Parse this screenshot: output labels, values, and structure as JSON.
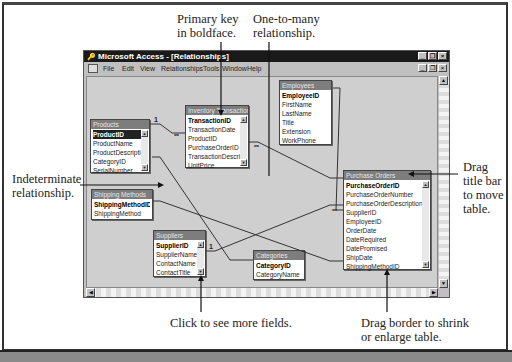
{
  "window": {
    "title": "Microsoft Access - [Relationships]",
    "controls": [
      "_",
      "❐",
      "×"
    ],
    "mdi_controls": [
      "_",
      "❐",
      "×"
    ]
  },
  "menu": [
    "File",
    "Edit",
    "View",
    "Relationships",
    "Tools",
    "Window",
    "Help"
  ],
  "tables": {
    "products": {
      "title": "Products",
      "fields": [
        "ProductID",
        "ProductName",
        "ProductDescriptic",
        "CategoryID",
        "SerialNumber"
      ],
      "primary_key": "ProductID"
    },
    "inventory_transactions": {
      "title": "Inventory Transactions",
      "fields": [
        "TransactionID",
        "TransactionDate",
        "ProductID",
        "PurchaseOrderID",
        "TransactionDescript",
        "UnitPrice"
      ],
      "primary_key": "TransactionID"
    },
    "employees": {
      "title": "Employees",
      "fields": [
        "EmployeeID",
        "FirstName",
        "LastName",
        "Title",
        "Extension",
        "WorkPhone"
      ],
      "primary_key": "EmployeeID"
    },
    "shipping_methods": {
      "title": "Shipping Methods",
      "fields": [
        "ShippingMethodID",
        "ShippingMethod"
      ],
      "primary_key": "ShippingMethodID"
    },
    "purchase_orders": {
      "title": "Purchase Orders",
      "fields": [
        "PurchaseOrderID",
        "PurchaseOrderNumber",
        "PurchaseOrderDescription",
        "SupplierID",
        "EmployeeID",
        "OrderDate",
        "DateRequired",
        "DatePromised",
        "ShipDate",
        "ShippingMethodID"
      ],
      "primary_key": "PurchaseOrderID"
    },
    "suppliers": {
      "title": "Suppliers",
      "fields": [
        "SupplierID",
        "SupplierName",
        "ContactName",
        "ContactTitle"
      ],
      "primary_key": "SupplierID"
    },
    "categories": {
      "title": "Categories",
      "fields": [
        "CategoryID",
        "CategoryName"
      ],
      "primary_key": "CategoryID"
    }
  },
  "relationship_symbols": {
    "one": "1",
    "many": "∞"
  },
  "callouts": {
    "primary_key": "Primary key\nin boldface.",
    "one_to_many": "One-to-many\nrelationship.",
    "drag_title": "Drag\ntitle bar\nto move\ntable.",
    "indeterminate": "Indeterminate\nrelationship.",
    "more_fields": "Click to see more fields.",
    "drag_border": "Drag border to shrink\nor enlarge table."
  }
}
